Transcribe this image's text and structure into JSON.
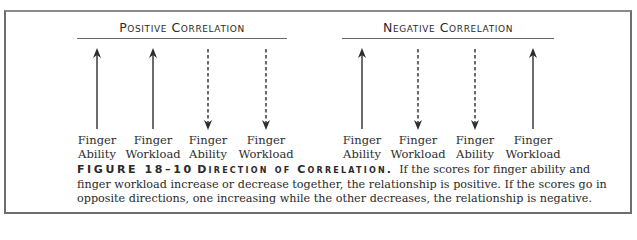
{
  "figure": {
    "number": "FIGURE 18–10",
    "title": "Direction of Correlation.",
    "caption": "If the scores for finger ability and finger workload increase or decrease together, the relationship is positive. If the scores go in opposite directions, one increasing while the other decreases, the relationship is negative."
  },
  "groups": [
    {
      "title": "Positive Correlation",
      "arrows": [
        {
          "label_line1": "Finger",
          "label_line2": "Ability",
          "direction": "up",
          "style": "solid",
          "x": 97
        },
        {
          "label_line1": "Finger",
          "label_line2": "Workload",
          "direction": "up",
          "style": "solid",
          "x": 153
        },
        {
          "label_line1": "Finger",
          "label_line2": "Ability",
          "direction": "down",
          "style": "dashed",
          "x": 208
        },
        {
          "label_line1": "Finger",
          "label_line2": "Workload",
          "direction": "down",
          "style": "dashed",
          "x": 266
        }
      ]
    },
    {
      "title": "Negative Correlation",
      "arrows": [
        {
          "label_line1": "Finger",
          "label_line2": "Ability",
          "direction": "up",
          "style": "solid",
          "x": 362
        },
        {
          "label_line1": "Finger",
          "label_line2": "Workload",
          "direction": "down",
          "style": "dashed",
          "x": 418
        },
        {
          "label_line1": "Finger",
          "label_line2": "Ability",
          "direction": "down",
          "style": "dashed",
          "x": 475
        },
        {
          "label_line1": "Finger",
          "label_line2": "Workload",
          "direction": "up",
          "style": "solid",
          "x": 533
        }
      ]
    }
  ],
  "colors": {
    "border": "#6e6e6e",
    "arrow": "#2e2e2e",
    "text": "#2a2a2a"
  }
}
